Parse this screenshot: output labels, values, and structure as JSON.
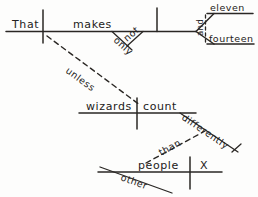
{
  "diagram": {
    "type": "reed-kellogg-sentence-diagram",
    "ink_color": "#2a2724",
    "background_color": "#fdfdfc",
    "words": {
      "subject_main": "That",
      "verb_main": "makes",
      "adverb_only": "only",
      "adverb_not": "not",
      "complement_one": "eleven",
      "complement_two": "fourteen",
      "conjunction_and": "and",
      "subordinator_unless": "unless",
      "subject_sub": "wizards",
      "verb_sub": "count",
      "adverb_differently": "differently",
      "conjunction_than": "than",
      "subject_comparison": "people",
      "modifier_other": "other",
      "elided_verb": "X"
    }
  }
}
